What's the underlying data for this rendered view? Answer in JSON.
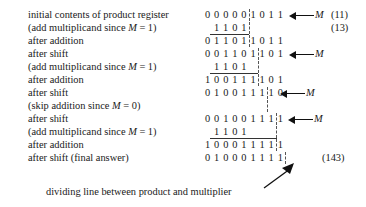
{
  "figure": {
    "type": "binary-multiplication-trace",
    "multiplicand_decimal": "13",
    "multiplier_decimal": "11",
    "product_decimal": "143",
    "register_note": "dividing line between product and multiplier"
  },
  "caption": {
    "text": "dividing line between product and multiplier"
  },
  "annotations": {
    "m_label": "M",
    "decimal_11": "(11)",
    "decimal_13": "(13)",
    "decimal_143": "(143)"
  },
  "rows": [
    {
      "id": "initial",
      "label": "initial contents of product register",
      "label_html": "initial contents of product register",
      "bits": "00000 1011",
      "bit_chars": [
        "0",
        "0",
        "0",
        "0",
        "0",
        "1",
        "0",
        "1",
        "1"
      ],
      "split_after": 5,
      "lead_blanks": 0,
      "has_m_arrow": true,
      "addbar": false,
      "decimal": "(11)"
    },
    {
      "id": "add-1",
      "label": "(add multiplicand since M = 1)",
      "label_prefix": "(add multiplicand since ",
      "label_var": "M",
      "label_suffix": " = 1)",
      "bits": "1101",
      "bit_chars": [
        "1",
        "1",
        "0",
        "1"
      ],
      "split_after": 4,
      "lead_blanks": 1,
      "has_m_arrow": false,
      "addbar": true,
      "decimal": "(13)"
    },
    {
      "id": "after-addition-1",
      "label": "after addition",
      "bits": "01101 1011",
      "bit_chars": [
        "0",
        "1",
        "1",
        "0",
        "1",
        "1",
        "0",
        "1",
        "1"
      ],
      "split_after": 5,
      "lead_blanks": 0,
      "has_m_arrow": false,
      "addbar": false,
      "decimal": ""
    },
    {
      "id": "after-shift-1",
      "label": "after shift",
      "bits": "001101 101",
      "bit_chars": [
        "0",
        "0",
        "1",
        "1",
        "0",
        "1",
        "1",
        "0",
        "1"
      ],
      "split_after": 6,
      "lead_blanks": 0,
      "has_m_arrow": true,
      "addbar": false,
      "decimal": ""
    },
    {
      "id": "add-2",
      "label": "(add multiplicand since M = 1)",
      "label_prefix": "(add multiplicand since ",
      "label_var": "M",
      "label_suffix": " = 1)",
      "bits": "1101",
      "bit_chars": [
        "1",
        "1",
        "0",
        "1"
      ],
      "split_after": 4,
      "lead_blanks": 1,
      "has_m_arrow": false,
      "addbar": true,
      "decimal": ""
    },
    {
      "id": "after-addition-2",
      "label": "after addition",
      "bits": "100111 101",
      "bit_chars": [
        "1",
        "0",
        "0",
        "1",
        "1",
        "1",
        "1",
        "0",
        "1"
      ],
      "split_after": 6,
      "lead_blanks": 0,
      "has_m_arrow": false,
      "addbar": false,
      "decimal": ""
    },
    {
      "id": "after-shift-2",
      "label": "after shift",
      "bits": "0100111 10",
      "bit_chars": [
        "0",
        "1",
        "0",
        "0",
        "1",
        "1",
        "1",
        "1",
        "0"
      ],
      "split_after": 7,
      "lead_blanks": 0,
      "has_m_arrow": true,
      "addbar": false,
      "decimal": ""
    },
    {
      "id": "skip",
      "label": "(skip addition since M = 0)",
      "label_prefix": "(skip addition since ",
      "label_var": "M",
      "label_suffix": " = 0)",
      "bits": "",
      "bit_chars": [],
      "split_after": 7,
      "lead_blanks": 0,
      "has_m_arrow": false,
      "addbar": false,
      "decimal": ""
    },
    {
      "id": "after-shift-3",
      "label": "after shift",
      "bits": "00100111 1",
      "bit_chars": [
        "0",
        "0",
        "1",
        "0",
        "0",
        "1",
        "1",
        "1",
        "1"
      ],
      "split_after": 8,
      "lead_blanks": 0,
      "has_m_arrow": true,
      "addbar": false,
      "decimal": ""
    },
    {
      "id": "add-3",
      "label": "(add multiplicand since M = 1)",
      "label_prefix": "(add multiplicand since ",
      "label_var": "M",
      "label_suffix": " = 1)",
      "bits": "1101",
      "bit_chars": [
        "1",
        "1",
        "0",
        "1"
      ],
      "split_after": 4,
      "lead_blanks": 1,
      "has_m_arrow": false,
      "addbar": true,
      "decimal": ""
    },
    {
      "id": "after-addition-3",
      "label": "after addition",
      "bits": "10001111 1",
      "bit_chars": [
        "1",
        "0",
        "0",
        "0",
        "1",
        "1",
        "1",
        "1",
        "1"
      ],
      "split_after": 8,
      "lead_blanks": 0,
      "has_m_arrow": false,
      "addbar": false,
      "decimal": ""
    },
    {
      "id": "final",
      "label": "after shift (final answer)",
      "bits": "010001111",
      "bit_chars": [
        "0",
        "1",
        "0",
        "0",
        "0",
        "1",
        "1",
        "1",
        "1"
      ],
      "split_after": 9,
      "lead_blanks": 0,
      "has_m_arrow": false,
      "addbar": false,
      "decimal": "(143)"
    }
  ]
}
